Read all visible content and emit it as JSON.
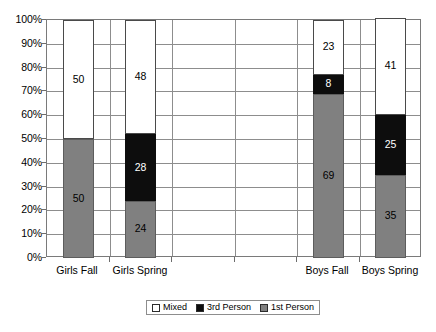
{
  "chart_data": {
    "type": "bar",
    "stacked": true,
    "stack_total_percent": 100,
    "title": "",
    "subtitle": "",
    "xlabel": "",
    "ylabel": "",
    "ylim": [
      0,
      100
    ],
    "ytick_step": 10,
    "ytick_labels": [
      "100%",
      "90%",
      "80%",
      "70%",
      "60%",
      "50%",
      "40%",
      "30%",
      "20%",
      "10%",
      "0%"
    ],
    "ytick_values": [
      100,
      90,
      80,
      70,
      60,
      50,
      40,
      30,
      20,
      10,
      0
    ],
    "grid": true,
    "legend_position": "bottom",
    "categories": [
      "Girls Fall",
      "Girls Spring",
      "",
      "",
      "Boys Fall",
      "Boys Spring"
    ],
    "series": [
      {
        "name": "Mixed",
        "color": "#ffffff",
        "values": [
          50,
          48,
          null,
          null,
          23,
          41
        ]
      },
      {
        "name": "3rd Person",
        "color": "#0d0d0d",
        "values": [
          0,
          28,
          null,
          null,
          8,
          25
        ]
      },
      {
        "name": "1st Person",
        "color": "#808080",
        "values": [
          50,
          24,
          null,
          null,
          69,
          35
        ]
      }
    ],
    "bars": [
      {
        "category": "Girls Fall",
        "slot": 0,
        "segments": [
          {
            "series": "1st Person",
            "value": 50,
            "label": "50",
            "label_color": "dark"
          },
          {
            "series": "3rd Person",
            "value": 0,
            "label": "0",
            "label_color": "dark"
          },
          {
            "series": "Mixed",
            "value": 50,
            "label": "50",
            "label_color": "dark"
          }
        ]
      },
      {
        "category": "Girls Spring",
        "slot": 1,
        "segments": [
          {
            "series": "1st Person",
            "value": 24,
            "label": "24",
            "label_color": "dark"
          },
          {
            "series": "3rd Person",
            "value": 28,
            "label": "28",
            "label_color": "light"
          },
          {
            "series": "Mixed",
            "value": 48,
            "label": "48",
            "label_color": "dark"
          }
        ]
      },
      {
        "category": "Boys Fall",
        "slot": 4,
        "segments": [
          {
            "series": "1st Person",
            "value": 69,
            "label": "69",
            "label_color": "dark"
          },
          {
            "series": "3rd Person",
            "value": 8,
            "label": "8",
            "label_color": "light"
          },
          {
            "series": "Mixed",
            "value": 23,
            "label": "23",
            "label_color": "dark"
          }
        ]
      },
      {
        "category": "Boys Spring",
        "slot": 5,
        "segments": [
          {
            "series": "1st Person",
            "value": 35,
            "label": "35",
            "label_color": "dark"
          },
          {
            "series": "3rd Person",
            "value": 25,
            "label": "25",
            "label_color": "light"
          },
          {
            "series": "Mixed",
            "value": 41,
            "label": "41",
            "label_color": "dark"
          }
        ]
      }
    ]
  },
  "legend": {
    "items": [
      {
        "label": "Mixed",
        "swatch": "mixed"
      },
      {
        "label": "3rd Person",
        "swatch": "third"
      },
      {
        "label": "1st Person",
        "swatch": "first"
      }
    ]
  },
  "colors": {
    "mixed": "#ffffff",
    "third_person": "#0d0d0d",
    "first_person": "#808080",
    "grid": "#8d8d8d",
    "axis": "#7a7a7a"
  }
}
